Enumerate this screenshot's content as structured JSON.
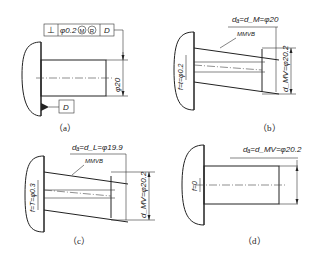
{
  "figure": {
    "panels": [
      {
        "id": "a",
        "caption": "（a）",
        "fcf": {
          "symbol": "⊥",
          "tolerance": "φ0.2",
          "modifier1": "M",
          "modifier2": "R",
          "datum": "D"
        },
        "datum_label": "D",
        "diameter": "φ20",
        "diameter_tol_upper": "0",
        "diameter_tol_lower": "-0.1"
      },
      {
        "id": "b",
        "caption": "（b）",
        "top_label": "dₐ=d_M=φ20",
        "mmvb_label": "MMVB",
        "f_label": "f=t=φ0.2",
        "dmv_label": "d_MV=φ20.2"
      },
      {
        "id": "c",
        "caption": "（c）",
        "top_label": "dₐ=d_L=φ19.9",
        "mmvb_label": "MMVB",
        "f_label": "f=T=φ0.3",
        "dmv_label": "d_MV=φ20.2"
      },
      {
        "id": "d",
        "caption": "（d）",
        "top_label": "dₐ=d_MV=φ20.2",
        "f_label": "f=0"
      }
    ]
  }
}
